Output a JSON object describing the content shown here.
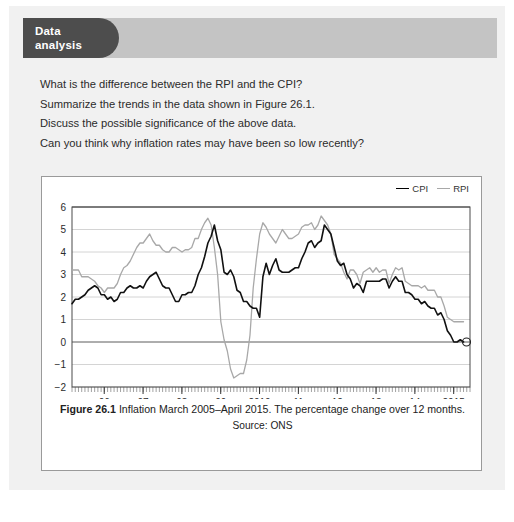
{
  "header": {
    "badge_line1": "Data",
    "badge_line2": "analysis",
    "badge_color": "#4d4d4d",
    "band_color": "#c4c4c4"
  },
  "questions": [
    "What is the difference between the RPI and the CPI?",
    "Summarize the trends in the data shown in Figure 26.1.",
    "Discuss the possible significance of the above data.",
    "Can you think why inflation rates may have been so low recently?"
  ],
  "figure": {
    "caption_label": "Figure 26.1",
    "caption_text": "Inflation March 2005–April 2015. The percentage change over 12 months.",
    "source": "Source: ONS"
  },
  "chart_data": {
    "type": "line",
    "title": "",
    "xlabel": "",
    "ylabel": "",
    "ylim": [
      -2,
      6
    ],
    "xlim": [
      2005.17,
      2015.42
    ],
    "grid": true,
    "legend_position": "top-right",
    "yticks": [
      6,
      5,
      4,
      3,
      2,
      1,
      0,
      -1,
      -2
    ],
    "ytick_labels": [
      "6",
      "5",
      "4",
      "3",
      "2",
      "1",
      "0",
      "−1",
      "−2"
    ],
    "xticks": [
      2005,
      2006,
      2007,
      2008,
      2009,
      2010,
      2011,
      2012,
      2013,
      2014,
      2015
    ],
    "xtick_labels": [
      "2005",
      "06",
      "07",
      "08",
      "09",
      "2010",
      "11",
      "12",
      "13",
      "14",
      "2015"
    ],
    "minor_tick_interval_months": 1,
    "colors": {
      "cpi": "#111111",
      "rpi": "#a8a8a8"
    },
    "end_marker": {
      "series": "CPI",
      "x": 2015.33,
      "y": 0.0
    },
    "series": [
      {
        "name": "CPI",
        "color": "#111111",
        "x_start": 2005.17,
        "x_step_months": 1,
        "values": [
          1.7,
          1.9,
          1.9,
          2.0,
          2.1,
          2.3,
          2.4,
          2.5,
          2.4,
          2.1,
          2.1,
          1.9,
          2.0,
          1.8,
          1.9,
          2.2,
          2.2,
          2.4,
          2.5,
          2.4,
          2.4,
          2.5,
          2.4,
          2.7,
          2.9,
          3.0,
          3.1,
          2.8,
          2.5,
          2.4,
          2.4,
          2.1,
          1.8,
          1.8,
          2.1,
          2.1,
          2.2,
          2.2,
          2.5,
          3.0,
          3.3,
          3.8,
          4.4,
          4.7,
          5.2,
          4.5,
          4.1,
          3.1,
          3.0,
          3.2,
          2.9,
          2.3,
          2.2,
          1.8,
          1.8,
          1.6,
          1.5,
          1.5,
          1.1,
          2.9,
          3.5,
          3.0,
          3.4,
          3.7,
          3.2,
          3.1,
          3.1,
          3.1,
          3.2,
          3.3,
          3.3,
          3.7,
          4.0,
          4.4,
          4.5,
          4.2,
          4.4,
          4.5,
          5.2,
          5.0,
          4.8,
          4.2,
          3.6,
          3.4,
          3.5,
          3.0,
          2.8,
          2.4,
          2.6,
          2.5,
          2.2,
          2.7,
          2.7,
          2.7,
          2.7,
          2.7,
          2.8,
          2.8,
          2.4,
          2.7,
          2.9,
          2.7,
          2.7,
          2.2,
          2.2,
          2.1,
          1.9,
          1.9,
          1.7,
          1.8,
          1.6,
          1.5,
          1.5,
          1.2,
          1.3,
          1.0,
          0.5,
          0.3,
          0.0,
          0.0,
          0.1,
          0.0
        ]
      },
      {
        "name": "RPI",
        "color": "#a8a8a8",
        "x_start": 2005.17,
        "x_step_months": 1,
        "values": [
          3.2,
          3.2,
          3.2,
          2.9,
          2.9,
          2.9,
          2.8,
          2.7,
          2.5,
          2.4,
          2.2,
          2.4,
          2.4,
          2.4,
          2.6,
          3.0,
          3.3,
          3.4,
          3.6,
          3.9,
          4.2,
          4.4,
          4.4,
          4.6,
          4.8,
          4.5,
          4.3,
          4.3,
          4.1,
          4.0,
          4.0,
          4.2,
          4.2,
          4.1,
          4.0,
          4.1,
          4.1,
          4.2,
          4.6,
          4.6,
          5.0,
          5.3,
          5.5,
          5.2,
          4.2,
          3.0,
          0.9,
          0.1,
          -0.4,
          -1.2,
          -1.6,
          -1.5,
          -1.4,
          -1.4,
          -0.8,
          0.3,
          2.4,
          3.7,
          4.8,
          5.3,
          5.1,
          4.8,
          4.6,
          4.4,
          4.7,
          5.0,
          4.8,
          4.6,
          4.6,
          4.7,
          4.8,
          5.1,
          5.2,
          5.2,
          5.3,
          5.0,
          5.2,
          5.6,
          5.4,
          5.2,
          4.8,
          3.9,
          3.7,
          3.5,
          3.1,
          2.8,
          3.2,
          3.2,
          3.0,
          2.6,
          3.1,
          3.2,
          3.3,
          3.1,
          3.3,
          3.1,
          3.2,
          3.2,
          2.6,
          3.0,
          3.3,
          3.2,
          3.3,
          2.7,
          2.6,
          2.5,
          2.5,
          2.5,
          2.4,
          2.5,
          2.3,
          2.3,
          2.3,
          2.0,
          2.0,
          1.6,
          1.1,
          1.0,
          0.9,
          0.9,
          0.9,
          0.9
        ]
      }
    ]
  }
}
